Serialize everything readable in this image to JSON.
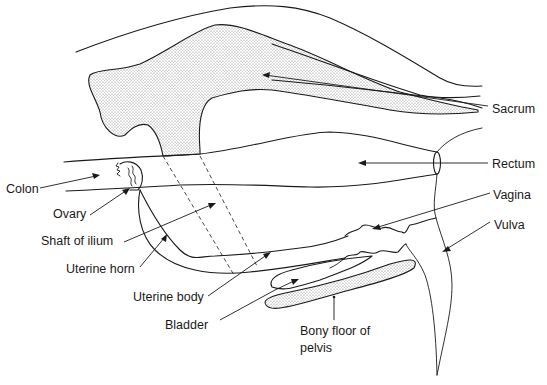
{
  "diagram": {
    "title": "",
    "type": "anatomical-sagittal-section",
    "labels": [
      {
        "id": "sacrum",
        "text": "Sacrum",
        "x": 492,
        "y": 102
      },
      {
        "id": "rectum",
        "text": "Rectum",
        "x": 492,
        "y": 157
      },
      {
        "id": "colon",
        "text": "Colon",
        "x": 6,
        "y": 182
      },
      {
        "id": "vagina",
        "text": "Vagina",
        "x": 493,
        "y": 188
      },
      {
        "id": "ovary",
        "text": "Ovary",
        "x": 53,
        "y": 207
      },
      {
        "id": "vulva",
        "text": "Vulva",
        "x": 494,
        "y": 218
      },
      {
        "id": "shaft_of_ilium",
        "text": "Shaft of ilium",
        "x": 41,
        "y": 234
      },
      {
        "id": "uterine_horn",
        "text": "Uterine horn",
        "x": 66,
        "y": 262
      },
      {
        "id": "uterine_body",
        "text": "Uterine body",
        "x": 133,
        "y": 290
      },
      {
        "id": "bladder",
        "text": "Bladder",
        "x": 165,
        "y": 318
      },
      {
        "id": "bony_floor_line1",
        "text": "Bony floor of",
        "x": 300,
        "y": 324
      },
      {
        "id": "bony_floor_line2",
        "text": "pelvis",
        "x": 300,
        "y": 341
      }
    ],
    "structures": [
      "Sacrum",
      "Rectum",
      "Colon",
      "Vagina",
      "Ovary",
      "Vulva",
      "Shaft of ilium",
      "Uterine horn",
      "Uterine body",
      "Bladder",
      "Bony floor of pelvis"
    ],
    "colors": {
      "line": "#1a1a1a",
      "stipple": "#9a9a9a",
      "background": "#ffffff"
    }
  }
}
